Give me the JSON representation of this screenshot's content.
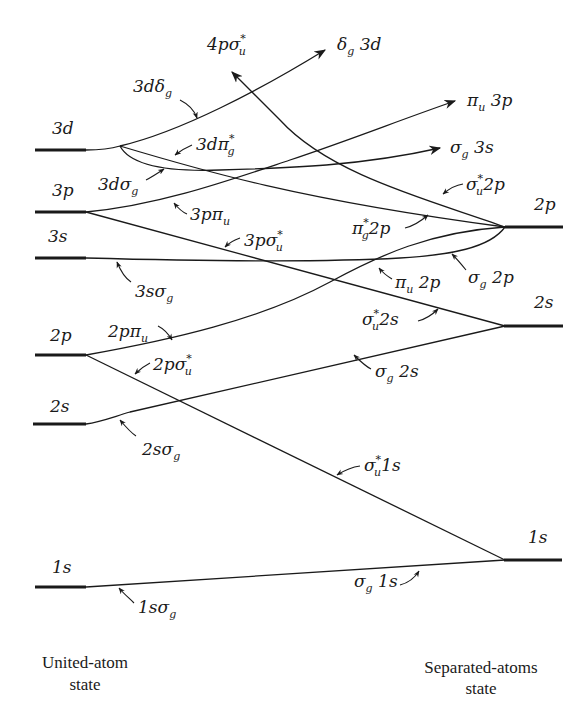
{
  "diagram": {
    "left_caption": {
      "line1": "United-atom",
      "line2": "state"
    },
    "right_caption": {
      "line1": "Separated-atoms",
      "line2": "state"
    },
    "left_levels": [
      {
        "label": "3d",
        "y": 150
      },
      {
        "label": "3p",
        "y": 212
      },
      {
        "label": "3s",
        "y": 258
      },
      {
        "label": "2p",
        "y": 355
      },
      {
        "label": "2s",
        "y": 424
      },
      {
        "label": "1s",
        "y": 587
      }
    ],
    "right_levels": [
      {
        "label": "2p",
        "y": 227
      },
      {
        "label": "2s",
        "y": 326
      },
      {
        "label": "1s",
        "y": 560
      }
    ],
    "united_atom_labels": {
      "l3ddelta": {
        "main": "3dδ",
        "sub": "g"
      },
      "l3dpi": {
        "main": "3dπ",
        "sup": "*",
        "sub": "g"
      },
      "l3dsigma": {
        "main": "3dσ",
        "sub": "g"
      },
      "l3ppi": {
        "main": "3pπ",
        "sub": "u"
      },
      "l3psigma": {
        "main": "3pσ",
        "sup": "*",
        "sub": "u"
      },
      "l3ssigma": {
        "main": "3sσ",
        "sub": "g"
      },
      "l2ppi": {
        "main": "2pπ",
        "sub": "u"
      },
      "l2psigma": {
        "main": "2pσ",
        "sup": "*",
        "sub": "u"
      },
      "l2ssigma": {
        "main": "2sσ",
        "sub": "g"
      },
      "l1ssigma": {
        "main": "1sσ",
        "sub": "g"
      },
      "l4psigma": {
        "main": "4pσ",
        "sup": "*",
        "sub": "u"
      }
    },
    "separated_atom_labels": {
      "r_delta3d": {
        "main": "δ",
        "sub": "g",
        "tail": " 3d"
      },
      "r_pi3p": {
        "main": "π",
        "sub": "u",
        "tail": " 3p"
      },
      "r_sigma3s": {
        "main": "σ",
        "sub": "g",
        "tail": " 3s"
      },
      "r_sigmastar2p": {
        "main": "σ",
        "sup": "*",
        "sub": "u",
        "tail": "2p"
      },
      "r_pistar2p": {
        "main": "π",
        "sup": "*",
        "sub": "g",
        "tail": "2p"
      },
      "r_sigma2p": {
        "main": "σ",
        "sub": "g",
        "tail": " 2p"
      },
      "r_pi2p": {
        "main": "π",
        "sub": "u",
        "tail": " 2p"
      },
      "r_sigmastar2s": {
        "main": "σ",
        "sup": "*",
        "sub": "u",
        "tail": "2s"
      },
      "r_sigma2s": {
        "main": "σ",
        "sub": "g",
        "tail": " 2s"
      },
      "r_sigmastar1s": {
        "main": "σ",
        "sup": "*",
        "sub": "u",
        "tail": "1s"
      },
      "r_sigma1s": {
        "main": "σ",
        "sub": "g",
        "tail": " 1s"
      }
    },
    "colors": {
      "ink": "#1a1a1a",
      "background": "#ffffff"
    }
  }
}
